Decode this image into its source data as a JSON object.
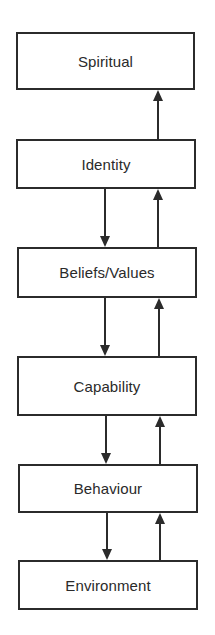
{
  "diagram": {
    "levels": [
      {
        "label": "Spiritual"
      },
      {
        "label": "Identity"
      },
      {
        "label": "Beliefs/Values"
      },
      {
        "label": "Capability"
      },
      {
        "label": "Behaviour"
      },
      {
        "label": "Environment"
      }
    ],
    "connections": [
      {
        "from": "Identity",
        "to": "Spiritual",
        "direction": "up"
      },
      {
        "from": "Identity",
        "to": "Beliefs/Values",
        "direction": "down"
      },
      {
        "from": "Beliefs/Values",
        "to": "Identity",
        "direction": "up"
      },
      {
        "from": "Beliefs/Values",
        "to": "Capability",
        "direction": "down"
      },
      {
        "from": "Capability",
        "to": "Beliefs/Values",
        "direction": "up"
      },
      {
        "from": "Capability",
        "to": "Behaviour",
        "direction": "down"
      },
      {
        "from": "Behaviour",
        "to": "Capability",
        "direction": "up"
      },
      {
        "from": "Behaviour",
        "to": "Environment",
        "direction": "down"
      },
      {
        "from": "Environment",
        "to": "Behaviour",
        "direction": "up"
      }
    ],
    "colors": {
      "line": "#2b2b2b",
      "text": "#2a2a2a",
      "background": "#ffffff"
    }
  }
}
